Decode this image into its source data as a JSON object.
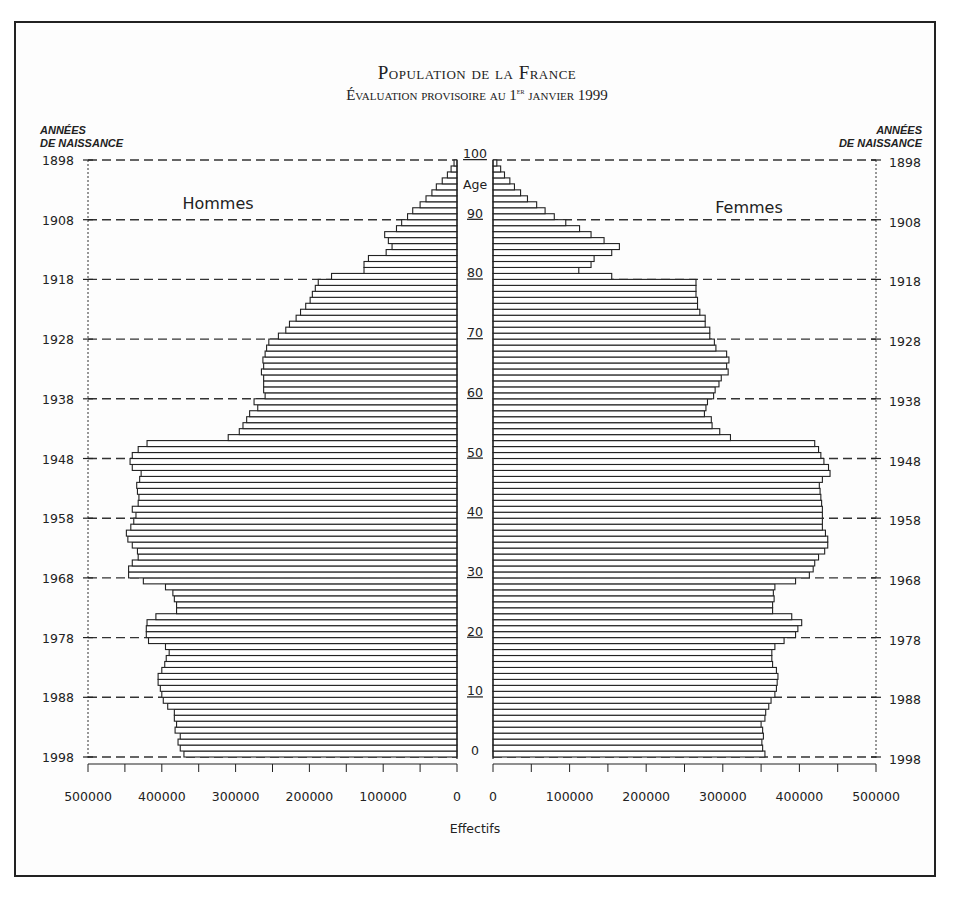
{
  "header": {
    "title": "Population de la France",
    "subtitle_pre": "Évaluation provisoire au 1",
    "subtitle_sup": "er",
    "subtitle_post": " janvier 1999",
    "left_axis_header_line1": "ANNÉES",
    "left_axis_header_line2": "DE NAISSANCE",
    "right_axis_header_line1": "ANNÉES",
    "right_axis_header_line2": "DE NAISSANCE"
  },
  "labels": {
    "men": "Hommes",
    "women": "Femmes",
    "age": "Age",
    "xlabel": "Effectifs"
  },
  "chart_data": {
    "type": "bar",
    "subtype": "population-pyramid",
    "title": "Population de la France",
    "subtitle": "Évaluation provisoire au 1er janvier 1999",
    "xlabel": "Effectifs",
    "ylabel_left": "Années de naissance",
    "ylabel_right": "Années de naissance",
    "center_label": "Age",
    "xlim": [
      0,
      500000
    ],
    "x_ticks": [
      500000,
      400000,
      300000,
      200000,
      100000,
      0,
      0,
      100000,
      200000,
      300000,
      400000,
      500000
    ],
    "age_ticks": [
      0,
      10,
      20,
      30,
      40,
      50,
      60,
      70,
      80,
      90,
      100
    ],
    "year_ticks": [
      1898,
      1908,
      1918,
      1928,
      1938,
      1948,
      1958,
      1968,
      1978,
      1988,
      1998
    ],
    "grid": "dashed horizontal lines every 10 years",
    "legend": [
      "Hommes",
      "Femmes"
    ],
    "ages": [
      0,
      1,
      2,
      3,
      4,
      5,
      6,
      7,
      8,
      9,
      10,
      11,
      12,
      13,
      14,
      15,
      16,
      17,
      18,
      19,
      20,
      21,
      22,
      23,
      24,
      25,
      26,
      27,
      28,
      29,
      30,
      31,
      32,
      33,
      34,
      35,
      36,
      37,
      38,
      39,
      40,
      41,
      42,
      43,
      44,
      45,
      46,
      47,
      48,
      49,
      50,
      51,
      52,
      53,
      54,
      55,
      56,
      57,
      58,
      59,
      60,
      61,
      62,
      63,
      64,
      65,
      66,
      67,
      68,
      69,
      70,
      71,
      72,
      73,
      74,
      75,
      76,
      77,
      78,
      79,
      80,
      81,
      82,
      83,
      84,
      85,
      86,
      87,
      88,
      89,
      90,
      91,
      92,
      93,
      94,
      95,
      96,
      97,
      98,
      99
    ],
    "series": [
      {
        "name": "Hommes",
        "values": [
          370000,
          375000,
          378000,
          375000,
          382000,
          380000,
          383000,
          383000,
          392000,
          398000,
          400000,
          402000,
          405000,
          405000,
          400000,
          396000,
          394000,
          390000,
          395000,
          418000,
          421000,
          421000,
          420000,
          408000,
          380000,
          380000,
          383000,
          385000,
          395000,
          425000,
          445000,
          445000,
          440000,
          432000,
          433000,
          440000,
          446000,
          448000,
          442000,
          438000,
          435000,
          440000,
          432000,
          431000,
          433000,
          434000,
          430000,
          428000,
          440000,
          443000,
          440000,
          432000,
          420000,
          310000,
          295000,
          290000,
          285000,
          281000,
          270000,
          275000,
          260000,
          262000,
          262000,
          262000,
          265000,
          262000,
          263000,
          260000,
          258000,
          255000,
          242000,
          232000,
          227000,
          218000,
          212000,
          205000,
          199000,
          196000,
          192000,
          188000,
          170000,
          126000,
          126000,
          120000,
          96000,
          88000,
          93000,
          98000,
          82000,
          75000,
          67000,
          60000,
          50000,
          42000,
          34000,
          28000,
          20000,
          13000,
          8000,
          4000
        ]
      },
      {
        "name": "Femmes",
        "values": [
          355000,
          352000,
          351000,
          353000,
          352000,
          350000,
          355000,
          356000,
          360000,
          363000,
          368000,
          370000,
          371000,
          372000,
          370000,
          365000,
          364000,
          364000,
          368000,
          380000,
          395000,
          398000,
          403000,
          390000,
          365000,
          365000,
          367000,
          366000,
          368000,
          395000,
          413000,
          418000,
          420000,
          425000,
          433000,
          437000,
          437000,
          434000,
          430000,
          430000,
          430000,
          430000,
          429000,
          428000,
          427000,
          426000,
          430000,
          440000,
          438000,
          432000,
          428000,
          425000,
          420000,
          310000,
          296000,
          286000,
          285000,
          276000,
          278000,
          280000,
          288000,
          290000,
          295000,
          298000,
          307000,
          305000,
          308000,
          305000,
          291000,
          289000,
          283000,
          283000,
          277000,
          277000,
          270000,
          267000,
          267000,
          265000,
          265000,
          265000,
          155000,
          112000,
          128000,
          132000,
          155000,
          165000,
          145000,
          128000,
          113000,
          95000,
          80000,
          68000,
          57000,
          45000,
          36000,
          28000,
          22000,
          15000,
          10000,
          5000
        ]
      }
    ]
  }
}
